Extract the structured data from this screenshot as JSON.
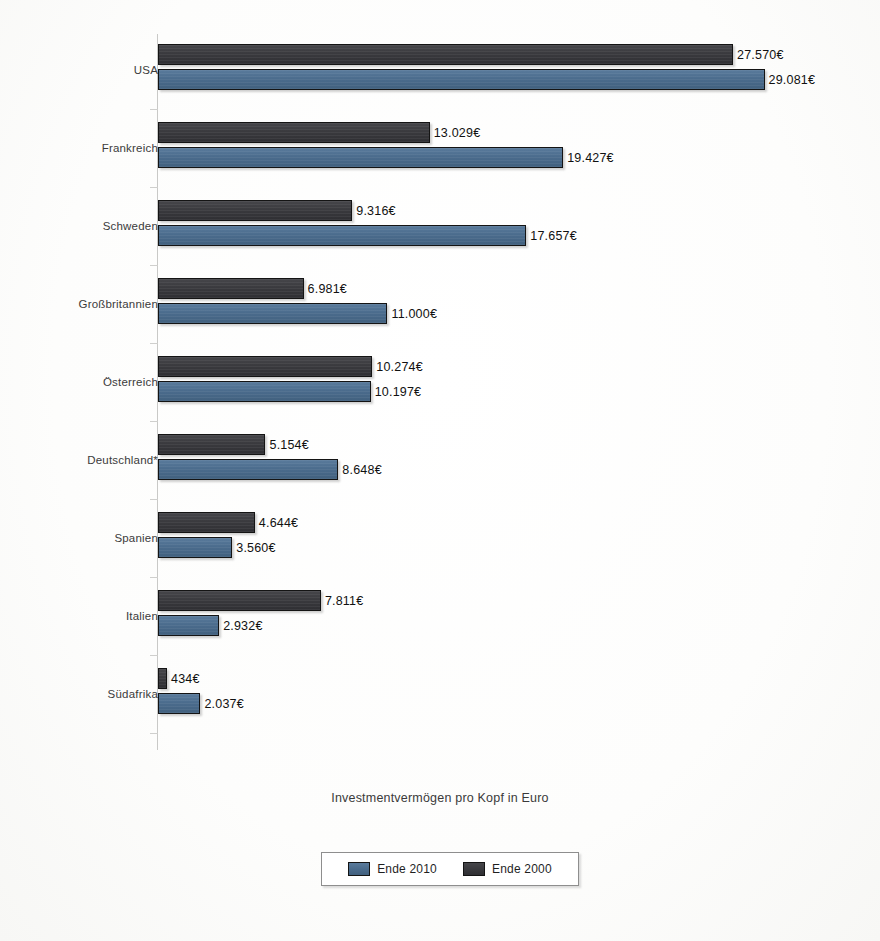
{
  "chart_data": {
    "type": "bar",
    "orientation": "horizontal",
    "title": "",
    "xlabel": "Investmentvermögen pro Kopf in Euro",
    "ylabel": "",
    "categories": [
      "USA",
      "Frankreich",
      "Schweden",
      "Großbritannien",
      "Österreich",
      "Deutschland*",
      "Spanien",
      "Italien",
      "Südafrika"
    ],
    "series": [
      {
        "name": "Ende 2000",
        "color": "#3a3a3e",
        "values": [
          27570,
          13029,
          9316,
          6981,
          10274,
          5154,
          4644,
          7811,
          434
        ],
        "labels": [
          "27.570€",
          "13.029€",
          "9.316€",
          "6.981€",
          "10.274€",
          "5.154€",
          "4.644€",
          "7.811€",
          "434€"
        ]
      },
      {
        "name": "Ende 2010",
        "color": "#4b6c8d",
        "values": [
          29081,
          19427,
          17657,
          11000,
          10197,
          8648,
          3560,
          2932,
          2037
        ],
        "labels": [
          "29.081€",
          "19.427€",
          "17.657€",
          "11.000€",
          "10.197€",
          "8.648€",
          "3.560€",
          "2.932€",
          "2.037€"
        ]
      }
    ],
    "xlim": [
      0,
      29081
    ],
    "grid": false,
    "legend_position": "bottom"
  },
  "axis_title": "Investmentvermögen pro Kopf in Euro",
  "legend": {
    "items": [
      {
        "label": "Ende 2010",
        "color": "#4b6c8d",
        "swatch": "blue"
      },
      {
        "label": "Ende 2000",
        "color": "#3a3a3e",
        "swatch": "dark"
      }
    ]
  }
}
